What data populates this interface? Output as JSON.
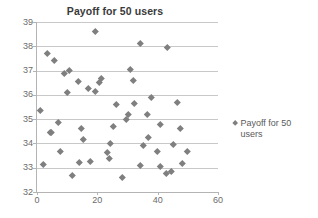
{
  "chart": {
    "title": "Payoff for 50 users",
    "legend_label": "Payoff for 50 users",
    "marker_icon": "diamond-marker-icon",
    "series_color": "#7f7f7f",
    "gridline_color": "#c8c8c8",
    "axis_color": "#b4b4b4"
  },
  "chart_data": {
    "type": "scatter",
    "title": "Payoff for 50 users",
    "xlabel": "",
    "ylabel": "",
    "xlim": [
      0,
      60
    ],
    "ylim": [
      32,
      39
    ],
    "xticks": [
      0,
      20,
      40,
      60
    ],
    "yticks": [
      32,
      33,
      34,
      35,
      36,
      37,
      38,
      39
    ],
    "grid": "horizontal",
    "legend_position": "right",
    "series": [
      {
        "name": "Payoff for 50 users",
        "marker": "diamond",
        "color": "#7f7f7f",
        "points": [
          [
            1.0,
            35.35
          ],
          [
            2.0,
            33.15
          ],
          [
            3.5,
            37.72
          ],
          [
            4.3,
            34.46
          ],
          [
            4.8,
            34.46
          ],
          [
            5.8,
            37.44
          ],
          [
            7.0,
            34.87
          ],
          [
            7.6,
            33.67
          ],
          [
            9.2,
            36.87
          ],
          [
            10.2,
            36.11
          ],
          [
            10.6,
            37.03
          ],
          [
            11.8,
            32.68
          ],
          [
            13.6,
            36.57
          ],
          [
            14.0,
            33.22
          ],
          [
            14.6,
            34.64
          ],
          [
            15.4,
            34.17
          ],
          [
            17.0,
            36.29
          ],
          [
            17.6,
            33.26
          ],
          [
            19.2,
            38.6
          ],
          [
            19.4,
            36.13
          ],
          [
            20.8,
            36.5
          ],
          [
            21.4,
            36.7
          ],
          [
            23.4,
            33.63
          ],
          [
            24.0,
            33.4
          ],
          [
            24.2,
            34.0
          ],
          [
            25.4,
            34.69
          ],
          [
            26.4,
            35.6
          ],
          [
            28.2,
            32.62
          ],
          [
            29.6,
            34.98
          ],
          [
            30.2,
            35.22
          ],
          [
            31.0,
            37.04
          ],
          [
            31.8,
            36.6
          ],
          [
            32.4,
            35.64
          ],
          [
            34.2,
            38.14
          ],
          [
            34.4,
            33.08
          ],
          [
            35.2,
            33.93
          ],
          [
            36.6,
            35.21
          ],
          [
            37.0,
            34.26
          ],
          [
            38.0,
            35.91
          ],
          [
            39.8,
            33.66
          ],
          [
            40.8,
            33.04
          ],
          [
            41.0,
            34.77
          ],
          [
            42.8,
            32.79
          ],
          [
            43.2,
            37.95
          ],
          [
            44.4,
            32.84
          ],
          [
            45.2,
            33.97
          ],
          [
            46.6,
            35.7
          ],
          [
            47.6,
            34.62
          ],
          [
            48.2,
            33.17
          ],
          [
            49.8,
            33.67
          ]
        ]
      }
    ]
  }
}
